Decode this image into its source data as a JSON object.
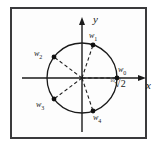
{
  "figure": {
    "type": "complex-plane-roots-diagram",
    "axes": {
      "x_label": "x",
      "y_label": "y"
    },
    "radius_annotation": {
      "index": "10",
      "radical": "√",
      "radicand": "2"
    },
    "points": [
      {
        "id": "w0",
        "label": "w",
        "subscript": "0",
        "angle_deg": 0,
        "x": 117,
        "y": 78,
        "label_x": 118,
        "label_y": 66
      },
      {
        "id": "w1",
        "label": "w",
        "subscript": "1",
        "angle_deg": 72,
        "x": 93,
        "y": 45,
        "label_x": 89,
        "label_y": 32
      },
      {
        "id": "w2",
        "label": "w",
        "subscript": "2",
        "angle_deg": 144,
        "x": 54,
        "y": 57,
        "label_x": 34,
        "label_y": 50
      },
      {
        "id": "w3",
        "label": "w",
        "subscript": "3",
        "angle_deg": 216,
        "x": 54,
        "y": 99,
        "label_x": 36,
        "label_y": 101
      },
      {
        "id": "w4",
        "label": "w",
        "subscript": "4",
        "angle_deg": 288,
        "x": 93,
        "y": 111,
        "label_x": 93,
        "label_y": 114
      }
    ],
    "circle": {
      "cx": 82,
      "cy": 78,
      "r": 35
    },
    "colors": {
      "frame": "#3a3a3c",
      "stroke": "#1a1a1a",
      "background": "#ffffff"
    }
  }
}
